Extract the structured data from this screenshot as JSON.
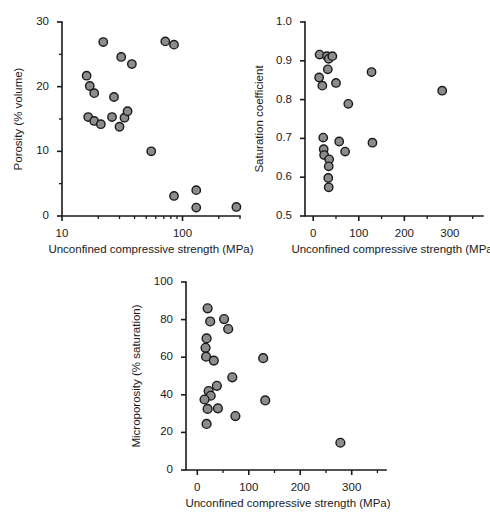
{
  "figure": {
    "marker_fill": "#8c8c8c",
    "marker_stroke": "#1a1a1a",
    "axis_color": "#1a1a1a",
    "background": "#ffffff"
  },
  "chart_data": [
    {
      "id": "porosity",
      "type": "scatter",
      "title": "",
      "xlabel": "Unconfined compressive strength (MPa)",
      "ylabel": "Porosity (% volume)",
      "xscale": "log",
      "yscale": "linear",
      "xlim": [
        10,
        300
      ],
      "ylim": [
        0,
        30
      ],
      "xticks": [
        10,
        100
      ],
      "xtick_labels": [
        "10",
        "100"
      ],
      "yticks": [
        0,
        10,
        20,
        30
      ],
      "ytick_labels": [
        "0",
        "10",
        "20",
        "30"
      ],
      "yticks_minor": [
        5,
        15,
        25
      ],
      "grid": false,
      "legend": "none",
      "points": [
        {
          "x": 16,
          "y": 21.7
        },
        {
          "x": 17,
          "y": 20.1
        },
        {
          "x": 18.5,
          "y": 19.0
        },
        {
          "x": 16.5,
          "y": 15.3
        },
        {
          "x": 18.5,
          "y": 14.7
        },
        {
          "x": 21,
          "y": 14.2
        },
        {
          "x": 22,
          "y": 26.9
        },
        {
          "x": 26,
          "y": 15.3
        },
        {
          "x": 27,
          "y": 18.4
        },
        {
          "x": 30,
          "y": 13.8
        },
        {
          "x": 31,
          "y": 24.6
        },
        {
          "x": 33,
          "y": 15.2
        },
        {
          "x": 35,
          "y": 16.2
        },
        {
          "x": 38,
          "y": 23.5
        },
        {
          "x": 55,
          "y": 10.0
        },
        {
          "x": 72,
          "y": 27.0
        },
        {
          "x": 85,
          "y": 26.5
        },
        {
          "x": 85,
          "y": 3.1
        },
        {
          "x": 130,
          "y": 4.0
        },
        {
          "x": 130,
          "y": 1.3
        },
        {
          "x": 280,
          "y": 1.4
        }
      ]
    },
    {
      "id": "saturation",
      "type": "scatter",
      "title": "",
      "xlabel": "Unconfined compressive strength (MPa)",
      "ylabel": "Saturation coefficient",
      "xscale": "linear",
      "yscale": "linear",
      "xlim": [
        -18,
        355
      ],
      "ylim": [
        0.5,
        1.0
      ],
      "xticks": [
        0,
        100,
        200,
        300
      ],
      "xtick_labels": [
        "0",
        "100",
        "200",
        "300"
      ],
      "xticks_minor": [
        50,
        150,
        250,
        350
      ],
      "yticks": [
        0.5,
        0.6,
        0.7,
        0.8,
        0.9,
        1.0
      ],
      "ytick_labels": [
        "0.5",
        "0.6",
        "0.7",
        "0.8",
        "0.9",
        "1.0"
      ],
      "grid": false,
      "legend": "none",
      "points": [
        {
          "x": 14,
          "y": 0.916
        },
        {
          "x": 30,
          "y": 0.912
        },
        {
          "x": 34,
          "y": 0.905
        },
        {
          "x": 42,
          "y": 0.912
        },
        {
          "x": 32,
          "y": 0.878
        },
        {
          "x": 13,
          "y": 0.857
        },
        {
          "x": 20,
          "y": 0.836
        },
        {
          "x": 50,
          "y": 0.843
        },
        {
          "x": 128,
          "y": 0.871
        },
        {
          "x": 283,
          "y": 0.823
        },
        {
          "x": 77,
          "y": 0.789
        },
        {
          "x": 22,
          "y": 0.702
        },
        {
          "x": 23,
          "y": 0.672
        },
        {
          "x": 24,
          "y": 0.657
        },
        {
          "x": 35,
          "y": 0.646
        },
        {
          "x": 34,
          "y": 0.628
        },
        {
          "x": 33,
          "y": 0.598
        },
        {
          "x": 34,
          "y": 0.574
        },
        {
          "x": 57,
          "y": 0.692
        },
        {
          "x": 70,
          "y": 0.666
        },
        {
          "x": 130,
          "y": 0.689
        }
      ]
    },
    {
      "id": "microporosity",
      "type": "scatter",
      "title": "",
      "xlabel": "Unconfined compressive strength (MPa)",
      "ylabel": "Microporosity (% saturation)",
      "xscale": "linear",
      "yscale": "linear",
      "xlim": [
        -22,
        355
      ],
      "ylim": [
        0,
        100
      ],
      "xticks": [
        0,
        100,
        200,
        300
      ],
      "xtick_labels": [
        "0",
        "100",
        "200",
        "300"
      ],
      "xticks_minor": [
        50,
        150,
        250,
        350
      ],
      "yticks": [
        0,
        20,
        40,
        60,
        80,
        100
      ],
      "ytick_labels": [
        "0",
        "20",
        "40",
        "60",
        "80",
        "100"
      ],
      "grid": false,
      "legend": "none",
      "points": [
        {
          "x": 20,
          "y": 86.0
        },
        {
          "x": 25,
          "y": 79.0
        },
        {
          "x": 52,
          "y": 80.3
        },
        {
          "x": 60,
          "y": 75.0
        },
        {
          "x": 18,
          "y": 70.0
        },
        {
          "x": 16,
          "y": 65.0
        },
        {
          "x": 17,
          "y": 60.3
        },
        {
          "x": 32,
          "y": 58.2
        },
        {
          "x": 128,
          "y": 59.5
        },
        {
          "x": 68,
          "y": 49.3
        },
        {
          "x": 38,
          "y": 44.8
        },
        {
          "x": 22,
          "y": 42.0
        },
        {
          "x": 26,
          "y": 39.5
        },
        {
          "x": 14,
          "y": 37.5
        },
        {
          "x": 132,
          "y": 37.0
        },
        {
          "x": 20,
          "y": 32.5
        },
        {
          "x": 40,
          "y": 32.8
        },
        {
          "x": 74,
          "y": 28.7
        },
        {
          "x": 18,
          "y": 24.5
        },
        {
          "x": 278,
          "y": 14.5
        }
      ]
    }
  ]
}
